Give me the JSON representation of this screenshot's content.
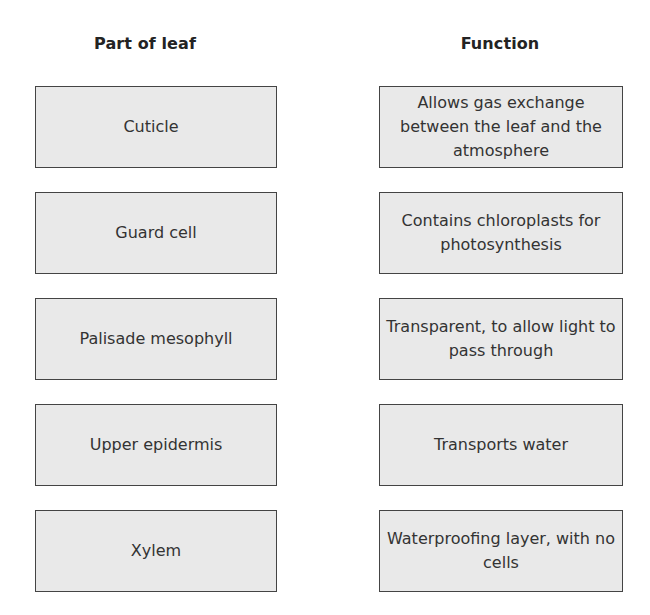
{
  "headers": {
    "parts": "Part of leaf",
    "functions": "Function"
  },
  "parts": [
    {
      "label": "Cuticle"
    },
    {
      "label": "Guard cell"
    },
    {
      "label": "Palisade mesophyll"
    },
    {
      "label": "Upper epidermis"
    },
    {
      "label": "Xylem"
    }
  ],
  "functions": [
    {
      "label": "Allows gas exchange between the leaf and the atmosphere"
    },
    {
      "label": "Contains chloroplasts for photosynthesis"
    },
    {
      "label": "Transparent, to allow light to pass through"
    },
    {
      "label": "Transports water"
    },
    {
      "label": "Waterproofing layer, with no cells"
    }
  ],
  "colors": {
    "box_fill": "#e9e9e9",
    "box_border": "#444444",
    "text": "#333333"
  }
}
